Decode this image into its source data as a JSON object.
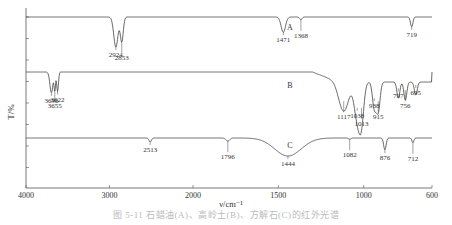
{
  "chart_data": {
    "type": "line",
    "title": "",
    "xlabel": "ν/cm⁻¹",
    "ylabel": "T/%",
    "xlim": [
      4000,
      600
    ],
    "x_ticks": [
      4000,
      3000,
      2000,
      1500,
      1000,
      600
    ],
    "x_tick_labels": [
      "4000",
      "3000",
      "2000",
      "1500",
      "1000",
      "600"
    ],
    "x_scale_note": "axis expanded 2x below 2000 cm-1",
    "grid": false,
    "series": [
      {
        "name": "A",
        "baseline": 0.92,
        "peaks": [
          {
            "x": 2924,
            "depth": 0.55,
            "width": 35,
            "label": "2924"
          },
          {
            "x": 2853,
            "depth": 0.45,
            "width": 25,
            "label": "2853"
          },
          {
            "x": 1471,
            "depth": 0.28,
            "width": 18,
            "label": "1471"
          },
          {
            "x": 1368,
            "depth": 0.05,
            "width": 10,
            "label": "1368"
          },
          {
            "x": 719,
            "depth": 0.18,
            "width": 10,
            "label": "719"
          }
        ]
      },
      {
        "name": "B",
        "baseline": 0.62,
        "peaks": [
          {
            "x": 3696,
            "depth": 0.32,
            "width": 25,
            "label": "3696"
          },
          {
            "x": 3655,
            "depth": 0.28,
            "width": 12,
            "label": "3655"
          },
          {
            "x": 3622,
            "depth": 0.3,
            "width": 15,
            "label": "3622"
          },
          {
            "x": 1117,
            "depth": 0.45,
            "width": 40,
            "label": "1117"
          },
          {
            "x": 1038,
            "depth": 0.55,
            "width": 25,
            "label": "1038"
          },
          {
            "x": 1013,
            "depth": 0.55,
            "width": 20,
            "label": "1013"
          },
          {
            "x": 938,
            "depth": 0.4,
            "width": 15,
            "label": "938"
          },
          {
            "x": 915,
            "depth": 0.45,
            "width": 15,
            "label": "915"
          },
          {
            "x": 797,
            "depth": 0.25,
            "width": 12,
            "label": "797"
          },
          {
            "x": 756,
            "depth": 0.28,
            "width": 12,
            "label": "756"
          },
          {
            "x": 695,
            "depth": 0.2,
            "width": 12,
            "label": "695"
          }
        ]
      },
      {
        "name": "C",
        "baseline": 0.28,
        "peaks": [
          {
            "x": 2513,
            "depth": 0.1,
            "width": 20,
            "label": "2513"
          },
          {
            "x": 1796,
            "depth": 0.08,
            "width": 15,
            "label": "1796"
          },
          {
            "x": 1444,
            "depth": 0.45,
            "width": 110,
            "label": "1444"
          },
          {
            "x": 1082,
            "depth": 0.03,
            "width": 10,
            "label": "1082"
          },
          {
            "x": 876,
            "depth": 0.3,
            "width": 10,
            "label": "876"
          },
          {
            "x": 712,
            "depth": 0.12,
            "width": 8,
            "label": "712"
          }
        ]
      }
    ],
    "annotations": [
      "A",
      "B",
      "C"
    ]
  },
  "caption": "图 5-11 石蜡油(A)、高岭土(B)、方解石(C)的红外光谱"
}
